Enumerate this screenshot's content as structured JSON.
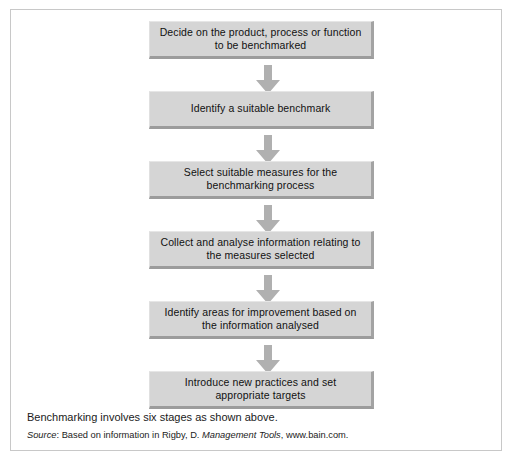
{
  "figure": {
    "caption": "Benchmarking involves six stages as shown above.",
    "source": {
      "label": "Source",
      "separator": ": ",
      "text_before": "Based on information in Rigby, D. ",
      "title": "Management Tools",
      "text_after": ", www.bain.com."
    }
  },
  "colors": {
    "box_fill": "#d5d5d5",
    "box_shadow": "#9c9c9c",
    "arrow_fill": "#b0b0b0",
    "frame_border": "#c8c8c8",
    "text": "#111111"
  },
  "flow": {
    "type": "vertical-process-flow",
    "step_count": 6,
    "nodes": [
      {
        "id": "step-1",
        "label": "Decide on the product, process or function\nto be benchmarked"
      },
      {
        "id": "step-2",
        "label": "Identify a suitable benchmark"
      },
      {
        "id": "step-3",
        "label": "Select suitable measures for the\nbenchmarking process"
      },
      {
        "id": "step-4",
        "label": "Collect and analyse information relating to\nthe measures selected"
      },
      {
        "id": "step-5",
        "label": "Identify areas for improvement based on\nthe information analysed"
      },
      {
        "id": "step-6",
        "label": "Introduce new practices and set\nappropriate targets"
      }
    ],
    "connectors": [
      {
        "id": "arrow-1-2",
        "from": "step-1",
        "to": "step-2",
        "direction": "down"
      },
      {
        "id": "arrow-2-3",
        "from": "step-2",
        "to": "step-3",
        "direction": "down"
      },
      {
        "id": "arrow-3-4",
        "from": "step-3",
        "to": "step-4",
        "direction": "down"
      },
      {
        "id": "arrow-4-5",
        "from": "step-4",
        "to": "step-5",
        "direction": "down"
      },
      {
        "id": "arrow-5-6",
        "from": "step-5",
        "to": "step-6",
        "direction": "down"
      }
    ]
  }
}
